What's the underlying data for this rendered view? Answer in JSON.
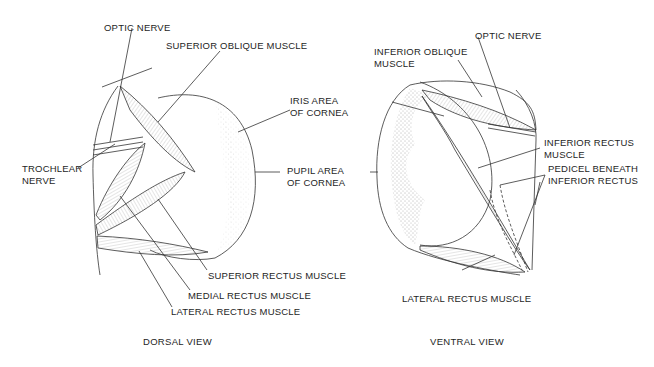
{
  "figure": {
    "dorsal": {
      "caption": "DORSAL VIEW",
      "labels": {
        "optic_nerve": "OPTIC NERVE",
        "superior_oblique": "SUPERIOR OBLIQUE MUSCLE",
        "trochlear_nerve": "TROCHLEAR\nNERVE",
        "superior_rectus": "SUPERIOR RECTUS MUSCLE",
        "medial_rectus": "MEDIAL RECTUS MUSCLE",
        "lateral_rectus": "LATERAL RECTUS MUSCLE"
      }
    },
    "shared": {
      "iris_area": "IRIS AREA\nOF CORNEA",
      "pupil_area": "PUPIL AREA\nOF CORNEA"
    },
    "ventral": {
      "caption": "VENTRAL VIEW",
      "labels": {
        "inferior_oblique": "INFERIOR OBLIQUE\nMUSCLE",
        "optic_nerve": "OPTIC NERVE",
        "inferior_rectus": "INFERIOR RECTUS\nMUSCLE",
        "pedicel": "PEDICEL BENEATH\nINFERIOR RECTUS",
        "lateral_rectus": "LATERAL RECTUS MUSCLE"
      }
    }
  }
}
